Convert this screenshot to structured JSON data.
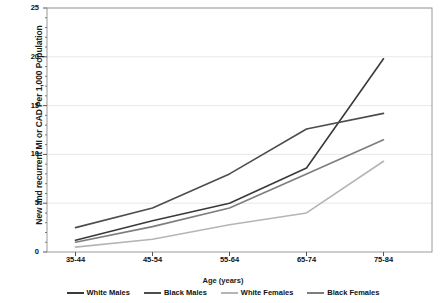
{
  "chart_data": {
    "type": "line",
    "title": "",
    "xlabel": "Age (years)",
    "ylabel": "New and recurrent MI or CAD Per 1,000 Population",
    "categories": [
      "35-44",
      "45-54",
      "55-64",
      "65-74",
      "75-84"
    ],
    "ylim": [
      0,
      25
    ],
    "yticks": [
      0,
      5,
      10,
      15,
      20,
      25
    ],
    "ytick_labels": [
      "0",
      "5",
      "10",
      "15",
      "20",
      "25"
    ],
    "grid": true,
    "legend_position": "bottom",
    "series": [
      {
        "name": "White Males",
        "color": "#3a3a3a",
        "values": [
          1.2,
          3.2,
          5.0,
          8.6,
          19.8
        ]
      },
      {
        "name": "Black Males",
        "color": "#4d4d4d",
        "values": [
          2.5,
          4.5,
          8.0,
          12.6,
          14.2
        ]
      },
      {
        "name": "White Females",
        "color": "#b5b5b5",
        "values": [
          0.5,
          1.3,
          2.8,
          4.0,
          9.3
        ]
      },
      {
        "name": "Black Females",
        "color": "#7d7d7d",
        "values": [
          1.0,
          2.6,
          4.5,
          8.0,
          11.5
        ]
      }
    ]
  },
  "axes": {
    "frame_color": "#9a9a9a",
    "grid_color": "#e8e8e8"
  }
}
